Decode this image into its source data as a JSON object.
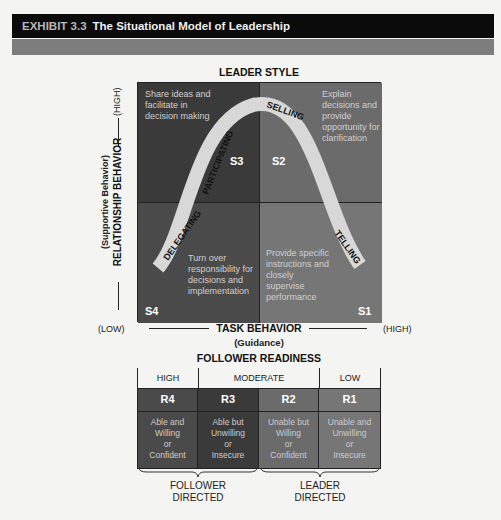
{
  "header": {
    "exhibit": "EXHIBIT 3.3",
    "title": "The Situational Model of Leadership"
  },
  "diagram": {
    "leader_style_title": "LEADER STYLE",
    "y_axis": {
      "label": "RELATIONSHIP BEHAVIOR",
      "sublabel": "(Supportive Behavior)",
      "high": "(HIGH)",
      "low": "(LOW)"
    },
    "x_axis": {
      "label": "TASK BEHAVIOR",
      "sublabel": "(Guidance)",
      "low": "(LOW)",
      "high": "(HIGH)"
    },
    "quadrants": {
      "s3": {
        "code": "S3",
        "style": "PARTICIPATING",
        "desc": "Share ideas and facilitate in decision making",
        "color": "#3a3a3a"
      },
      "s2": {
        "code": "S2",
        "style": "SELLING",
        "desc": "Explain decisions and provide opportunity for clarification",
        "color": "#6b6b6b"
      },
      "s4": {
        "code": "S4",
        "style": "DELEGATING",
        "desc": "Turn over responsibility for decisions and implementation",
        "color": "#4a4a4a"
      },
      "s1": {
        "code": "S1",
        "style": "TELLING",
        "desc": "Provide specific instructions and closely supervise performance",
        "color": "#767676"
      }
    },
    "curve_color": "#d8d8d8"
  },
  "readiness": {
    "title": "FOLLOWER READINESS",
    "levels": [
      "HIGH",
      "MODERATE",
      "LOW"
    ],
    "cells": [
      {
        "code": "R4",
        "lines": [
          "Able and",
          "Willing",
          "or",
          "Confident"
        ],
        "color": "#4a4a4a"
      },
      {
        "code": "R3",
        "lines": [
          "Able but",
          "Unwilling",
          "or",
          "Insecure"
        ],
        "color": "#3a3a3a"
      },
      {
        "code": "R2",
        "lines": [
          "Unable but",
          "Willing",
          "or",
          "Confident"
        ],
        "color": "#6b6b6b"
      },
      {
        "code": "R1",
        "lines": [
          "Unable and",
          "Unwilling",
          "or",
          "Insecure"
        ],
        "color": "#767676"
      }
    ],
    "groups": [
      {
        "line1": "FOLLOWER",
        "line2": "DIRECTED"
      },
      {
        "line1": "LEADER",
        "line2": "DIRECTED"
      }
    ]
  }
}
